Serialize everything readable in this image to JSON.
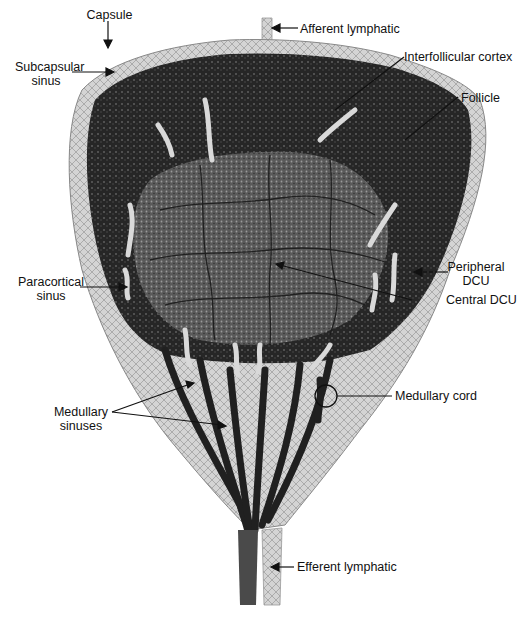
{
  "diagram": {
    "labels": {
      "capsule": "Capsule",
      "afferent_lymphatic": "Afferent lymphatic",
      "subcapsular_sinus_line1": "Subcapsular",
      "subcapsular_sinus_line2": "sinus",
      "interfollicular_cortex": "Interfollicular cortex",
      "follicle": "Follicle",
      "peripheral_dcu_line1": "Peripheral",
      "peripheral_dcu_line2": "DCU",
      "central_dcu": "Central DCU",
      "paracortical_sinus_line1": "Paracortical",
      "paracortical_sinus_line2": "sinus",
      "medullary_sinuses_line1": "Medullary",
      "medullary_sinuses_line2": "sinuses",
      "medullary_cord": "Medullary cord",
      "efferent_lymphatic": "Efferent lymphatic"
    },
    "colors": {
      "capsule": "#cfcfcf",
      "cortex_dark": "#1c1c1c",
      "paracortex": "#5a5a5a",
      "sinus_light": "#d9d9d9",
      "medulla": "#bdbdbd",
      "vessel": "#202020",
      "label_text": "#111111"
    }
  }
}
